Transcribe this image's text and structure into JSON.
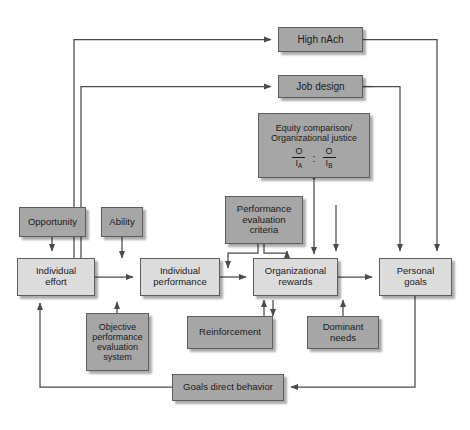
{
  "diagram": {
    "type": "flowchart",
    "palette": {
      "box_secondary": "#a6a6a6",
      "box_primary": "#dcdcdc",
      "border": "#5d5d5d",
      "wire": "#4a4a4a",
      "background": "#ffffff"
    },
    "nodes": [
      {
        "id": "high-nach",
        "label": "High nAch",
        "style": "dark",
        "x": 278,
        "y": 27,
        "w": 85,
        "h": 25,
        "font": 10
      },
      {
        "id": "job-design",
        "label": "Job design",
        "style": "dark",
        "x": 278,
        "y": 75,
        "w": 85,
        "h": 23,
        "font": 10
      },
      {
        "id": "equity",
        "label": "Equity comparison/\nOrganizational justice",
        "style": "dark",
        "x": 258,
        "y": 113,
        "w": 112,
        "h": 65,
        "font": 9
      },
      {
        "id": "opportunity",
        "label": "Opportunity",
        "style": "dark",
        "x": 19,
        "y": 207,
        "w": 67,
        "h": 30,
        "font": 9.5
      },
      {
        "id": "ability",
        "label": "Ability",
        "style": "dark",
        "x": 101,
        "y": 207,
        "w": 42,
        "h": 30,
        "font": 9.5
      },
      {
        "id": "perf-eval-criteria",
        "label": "Performance\nevaluation\ncriteria",
        "style": "dark",
        "x": 225,
        "y": 196,
        "w": 78,
        "h": 48,
        "font": 9.5
      },
      {
        "id": "individual-effort",
        "label": "Individual\neffort",
        "style": "light",
        "x": 17,
        "y": 258,
        "w": 78,
        "h": 38,
        "font": 9.5
      },
      {
        "id": "individual-performance",
        "label": "Individual\nperformance",
        "style": "light",
        "x": 140,
        "y": 258,
        "w": 80,
        "h": 38,
        "font": 9.5
      },
      {
        "id": "organizational-rewards",
        "label": "Organizational\nrewards",
        "style": "light",
        "x": 253,
        "y": 258,
        "w": 85,
        "h": 38,
        "font": 9.5
      },
      {
        "id": "personal-goals",
        "label": "Personal\ngoals",
        "style": "light",
        "x": 379,
        "y": 258,
        "w": 73,
        "h": 38,
        "font": 9.5
      },
      {
        "id": "objective-perf-eval-system",
        "label": "Objective\nperformance\nevaluation\nsystem",
        "style": "dark",
        "x": 86,
        "y": 313,
        "w": 63,
        "h": 58,
        "font": 9
      },
      {
        "id": "reinforcement",
        "label": "Reinforcement",
        "style": "dark",
        "x": 187,
        "y": 316,
        "w": 86,
        "h": 33,
        "font": 9.5
      },
      {
        "id": "dominant-needs",
        "label": "Dominant\nneeds",
        "style": "dark",
        "x": 307,
        "y": 316,
        "w": 72,
        "h": 33,
        "font": 9.5
      },
      {
        "id": "goals-direct-behavior",
        "label": "Goals direct behavior",
        "style": "dark",
        "x": 172,
        "y": 374,
        "w": 112,
        "h": 27,
        "font": 9.5
      }
    ],
    "equity_ratio": {
      "left_numerator": "O",
      "left_denominator": "I",
      "left_subscript": "A",
      "separator": ":",
      "right_numerator": "O",
      "right_denominator": "I",
      "right_subscript": "B"
    },
    "edges": [
      {
        "from": "individual-effort",
        "to": "high-nach",
        "kind": "arrow"
      },
      {
        "from": "individual-effort",
        "to": "job-design",
        "kind": "arrow"
      },
      {
        "from": "high-nach",
        "to": "personal-goals",
        "kind": "arrow"
      },
      {
        "from": "job-design",
        "to": "personal-goals",
        "kind": "arrow"
      },
      {
        "from": "job-design",
        "to": "organizational-rewards",
        "kind": "arrow"
      },
      {
        "from": "equity",
        "to": "organizational-rewards",
        "kind": "double-arrow"
      },
      {
        "from": "opportunity",
        "to": "individual-effort",
        "kind": "arrow"
      },
      {
        "from": "ability",
        "to": "individual-effort",
        "kind": "arrow"
      },
      {
        "from": "individual-effort",
        "to": "individual-performance",
        "kind": "arrow"
      },
      {
        "from": "individual-performance",
        "to": "organizational-rewards",
        "kind": "arrow"
      },
      {
        "from": "organizational-rewards",
        "to": "personal-goals",
        "kind": "arrow"
      },
      {
        "from": "perf-eval-criteria",
        "to": "organizational-rewards",
        "kind": "arrow"
      },
      {
        "from": "objective-perf-eval-system",
        "to": "individual-performance",
        "kind": "arrow"
      },
      {
        "from": "reinforcement",
        "to": "organizational-rewards",
        "kind": "double-arrow"
      },
      {
        "from": "dominant-needs",
        "to": "personal-goals",
        "kind": "arrow"
      },
      {
        "from": "personal-goals",
        "to": "goals-direct-behavior",
        "kind": "arrow"
      },
      {
        "from": "goals-direct-behavior",
        "to": "individual-effort",
        "kind": "arrow"
      }
    ]
  }
}
